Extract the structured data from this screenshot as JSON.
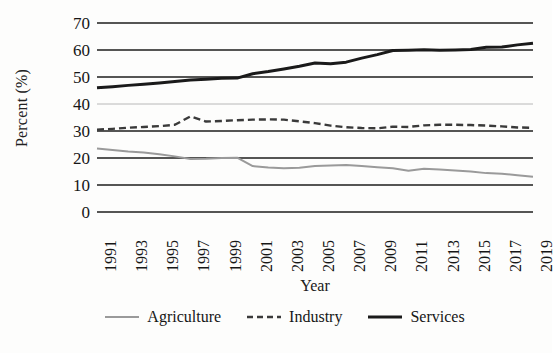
{
  "chart_data": {
    "type": "line",
    "title": "",
    "xlabel": "Year",
    "ylabel": "Percent (%)",
    "ylim": [
      0,
      70
    ],
    "ytick_values": [
      0,
      10,
      20,
      30,
      40,
      50,
      60,
      70
    ],
    "ytick_labels": [
      "0",
      "10",
      "20",
      "30",
      "40",
      "50",
      "60",
      "70"
    ],
    "grid": true,
    "grid_axis": "y",
    "legend_position": "bottom",
    "x": [
      1991,
      1992,
      1993,
      1994,
      1995,
      1996,
      1997,
      1998,
      1999,
      2000,
      2001,
      2002,
      2003,
      2004,
      2005,
      2006,
      2007,
      2008,
      2009,
      2010,
      2011,
      2012,
      2013,
      2014,
      2015,
      2016,
      2017,
      2018,
      2019
    ],
    "xtick_labels": [
      "1991",
      "1993",
      "1995",
      "1997",
      "1999",
      "2001",
      "2003",
      "2005",
      "2007",
      "2009",
      "2011",
      "2013",
      "2015",
      "2017",
      "2019"
    ],
    "xtick_values": [
      1991,
      1993,
      1995,
      1997,
      1999,
      2001,
      2003,
      2005,
      2007,
      2009,
      2011,
      2013,
      2015,
      2017,
      2019
    ],
    "series": [
      {
        "name": "Agriculture",
        "style": "solid",
        "color": "#9a9a9a",
        "width": 2.0,
        "values": [
          23.5,
          23.0,
          22.4,
          22.0,
          21.4,
          20.6,
          19.6,
          19.7,
          20.0,
          20.1,
          17.0,
          16.5,
          16.2,
          16.4,
          17.0,
          17.2,
          17.4,
          17.0,
          16.6,
          16.2,
          15.3,
          16.0,
          15.7,
          15.4,
          15.0,
          14.4,
          14.2,
          13.6,
          13.1
        ]
      },
      {
        "name": "Industry",
        "style": "dashed",
        "color": "#3a3a3a",
        "width": 2.4,
        "values": [
          30.5,
          30.8,
          31.2,
          31.5,
          31.8,
          32.3,
          35.4,
          33.5,
          33.7,
          34.0,
          34.2,
          34.3,
          34.2,
          33.6,
          32.9,
          32.0,
          31.4,
          31.1,
          31.0,
          31.6,
          31.5,
          32.1,
          32.3,
          32.3,
          32.2,
          32.0,
          31.7,
          31.3,
          31.2
        ]
      },
      {
        "name": "Services",
        "style": "solid",
        "color": "#1a1a1a",
        "width": 3.0,
        "values": [
          46.0,
          46.4,
          46.9,
          47.3,
          47.8,
          48.3,
          48.9,
          49.2,
          49.5,
          49.6,
          51.2,
          52.0,
          53.0,
          54.0,
          55.2,
          54.9,
          55.5,
          57.0,
          58.3,
          59.8,
          59.9,
          60.1,
          59.9,
          60.0,
          60.2,
          61.0,
          61.1,
          61.9,
          62.5
        ]
      }
    ]
  },
  "legend": {
    "items": [
      {
        "label": "Agriculture"
      },
      {
        "label": "Industry"
      },
      {
        "label": "Services"
      }
    ]
  }
}
